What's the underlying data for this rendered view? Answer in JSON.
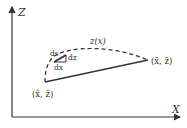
{
  "diagram": {
    "axes": {
      "x_label": "X",
      "y_label": "Z"
    },
    "curve_label": "z(x)",
    "start_point_label": "(x̂, ẑ)",
    "end_point_label": "(x̄, z̄)",
    "element_labels": {
      "ds": "ds",
      "dz": "dz",
      "dx": "dx"
    },
    "colors": {
      "line": "#333333",
      "background": "#ffffff"
    }
  }
}
